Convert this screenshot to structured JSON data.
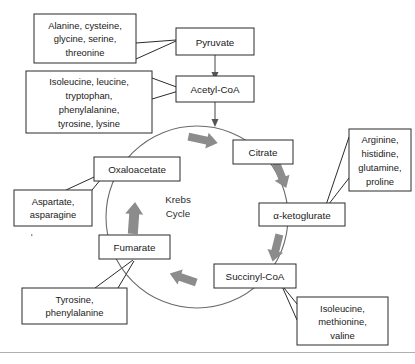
{
  "figure": {
    "title": "Krebs Cycle",
    "cycle_center_line1": "Krebs",
    "cycle_center_line2": "Cycle"
  },
  "pathway_nodes": {
    "pyruvate": "Pyruvate",
    "acetyl_coa": "Acetyl-CoA",
    "citrate": "Citrate",
    "alpha_ketoglutarate": "α-ketoglurate",
    "succinyl_coa": "Succinyl-CoA",
    "fumarate": "Fumarate",
    "oxaloacetate": "Oxaloacetate"
  },
  "amino_acid_groups": {
    "to_pyruvate": {
      "lines": [
        "Alanine, cysteine,",
        "glycine, serine,",
        "threonine"
      ]
    },
    "to_acetyl_coa": {
      "lines": [
        "Isoleucine, leucine,",
        "tryptophan,",
        "phenylalanine,",
        "tyrosine, lysine"
      ]
    },
    "to_alpha_ketoglutarate": {
      "lines": [
        "Arginine,",
        "histidine,",
        "glutamine,",
        "proline"
      ]
    },
    "to_succinyl_coa": {
      "lines": [
        "Isoleucine,",
        "methionine,",
        "valine"
      ]
    },
    "to_fumarate": {
      "lines": [
        "Tyrosine,",
        "phenylalanine"
      ]
    },
    "to_oxaloacetate": {
      "lines": [
        "Aspartate,",
        "asparagine"
      ]
    }
  },
  "colors": {
    "box_stroke": "#2b2b2b",
    "cycle_stroke": "#6b6b6b",
    "cycle_arrow": "#8c8c8c",
    "text": "#1a1a1a",
    "background": "#ffffff",
    "footer_rule": "#b0b0b0"
  }
}
